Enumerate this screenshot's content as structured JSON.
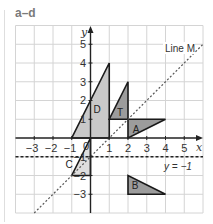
{
  "title": "a–d",
  "grid": {
    "x_min": -4,
    "x_max": 6,
    "y_min": -4,
    "y_max": 6,
    "origin_px": [
      90.5,
      138
    ],
    "unit_px": 18.75
  },
  "axes": {
    "x_label": "x",
    "y_label": "y",
    "x_ticks": [
      "−3",
      "−2",
      "−1",
      "0",
      "1",
      "2",
      "3",
      "4",
      "5"
    ],
    "y_ticks": [
      "5",
      "4",
      "3",
      "2",
      "1",
      "−1",
      "−2",
      "−3"
    ]
  },
  "lines": {
    "line_m": {
      "label": "Line M",
      "equation": "y = x − 1"
    },
    "y_minus_1": {
      "label": "y = −1"
    }
  },
  "shapes": [
    {
      "name": "D",
      "vertices": [
        [
          -1,
          0
        ],
        [
          1,
          0
        ],
        [
          1,
          4
        ]
      ],
      "fill": "#c9c9c9"
    },
    {
      "name": "T",
      "vertices": [
        [
          1,
          1
        ],
        [
          2,
          1
        ],
        [
          2,
          3
        ]
      ],
      "fill": "#9c9c9c"
    },
    {
      "name": "A",
      "vertices": [
        [
          2,
          0
        ],
        [
          2,
          1
        ],
        [
          4,
          1
        ]
      ],
      "fill": "#9c9c9c"
    },
    {
      "name": "C",
      "vertices": [
        [
          0,
          0
        ],
        [
          -1,
          -2
        ],
        [
          0,
          -2
        ]
      ],
      "fill": "#dedede"
    },
    {
      "name": "B",
      "vertices": [
        [
          2,
          -2
        ],
        [
          2,
          -3
        ],
        [
          4,
          -3
        ]
      ],
      "fill": "#9c9c9c"
    }
  ],
  "colors": {
    "grid": "#d4d4d4",
    "axis": "#222222",
    "title": "#7a7a7a"
  }
}
